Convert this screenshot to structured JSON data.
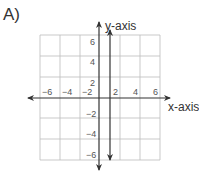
{
  "problem_label": "A)",
  "axes": {
    "x_label": "x-axis",
    "y_label": "y-axis",
    "x_ticks": [
      "−6",
      "−4",
      "−2",
      "2",
      "4",
      "6"
    ],
    "y_ticks": [
      "6",
      "4",
      "2",
      "−2",
      "−4",
      "−6"
    ],
    "range": [
      -6,
      6
    ],
    "grid_step": 2
  },
  "graph": {
    "line": "x = 1",
    "type": "vertical line",
    "color": "#333333"
  },
  "colors": {
    "grid": "#bbbbbb",
    "axis": "#333333",
    "text": "#555555"
  }
}
